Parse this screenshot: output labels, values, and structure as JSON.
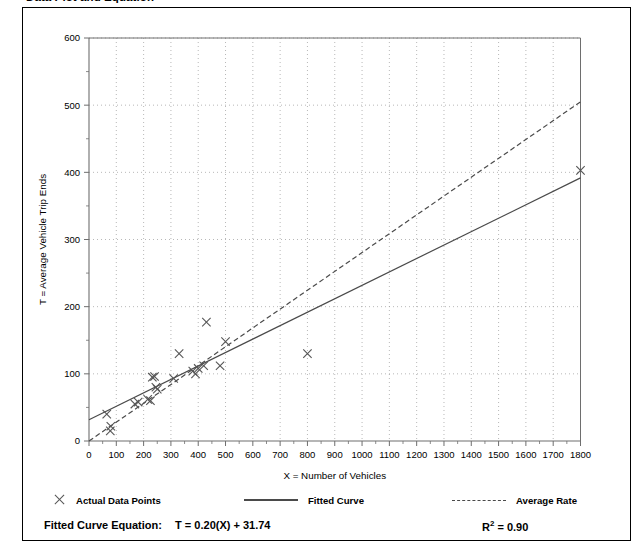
{
  "document": {
    "title": "Data Plot and Equation"
  },
  "legend": {
    "items": [
      {
        "label": "Actual Data Points",
        "marker": "x-marker-icon"
      },
      {
        "label": "Fitted Curve",
        "marker": "solid-line-icon"
      },
      {
        "label": "Average Rate",
        "marker": "dashed-line-icon"
      }
    ]
  },
  "equation": {
    "prefix": "Fitted Curve Equation:",
    "formula": "T = 0.20(X) + 31.74",
    "r_squared_symbol": "R",
    "r_squared_exponent": "2",
    "r_squared_value": "= 0.90"
  },
  "chart_data": {
    "type": "scatter",
    "title": "Data Plot and Equation",
    "xlabel": "X = Number of Vehicles",
    "ylabel": "T = Average Vehicle Trip Ends",
    "xlim": [
      0,
      1800
    ],
    "ylim": [
      0,
      600
    ],
    "xticks": [
      0,
      100,
      200,
      300,
      400,
      500,
      600,
      700,
      800,
      900,
      1000,
      1100,
      1200,
      1300,
      1400,
      1500,
      1600,
      1700,
      1800
    ],
    "yticks": [
      0,
      100,
      200,
      300,
      400,
      500,
      600
    ],
    "y_minor_interval": 50,
    "grid": true,
    "grid_style": "dotted",
    "legend_position": "below-plot",
    "series": [
      {
        "name": "Actual Data Points",
        "type": "scatter",
        "marker": "x",
        "color": "#555555",
        "points": [
          [
            65,
            40
          ],
          [
            78,
            15
          ],
          [
            80,
            22
          ],
          [
            168,
            55
          ],
          [
            180,
            58
          ],
          [
            215,
            62
          ],
          [
            225,
            60
          ],
          [
            232,
            95
          ],
          [
            240,
            96
          ],
          [
            245,
            80
          ],
          [
            250,
            77
          ],
          [
            310,
            93
          ],
          [
            330,
            130
          ],
          [
            380,
            104
          ],
          [
            390,
            100
          ],
          [
            400,
            108
          ],
          [
            420,
            112
          ],
          [
            430,
            177
          ],
          [
            480,
            112
          ],
          [
            500,
            148
          ],
          [
            800,
            130
          ],
          [
            1800,
            403
          ]
        ]
      },
      {
        "name": "Fitted Curve",
        "type": "line",
        "style": "solid",
        "color": "#4a4a4a",
        "equation": "T = 0.20(X) + 31.74",
        "slope": 0.2,
        "intercept": 31.74,
        "r_squared": 0.9,
        "endpoints": [
          [
            0,
            31.74
          ],
          [
            1800,
            391.74
          ]
        ]
      },
      {
        "name": "Average Rate",
        "type": "line",
        "style": "dashed",
        "color": "#4a4a4a",
        "slope": 0.28,
        "intercept": 0,
        "endpoints": [
          [
            0,
            0
          ],
          [
            1800,
            505
          ]
        ]
      }
    ]
  }
}
